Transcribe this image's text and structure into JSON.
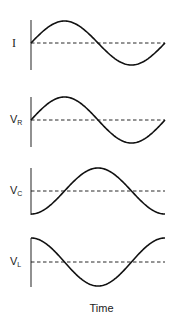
{
  "labels": {
    "current": "I",
    "vr_main": "V",
    "vr_sub": "R",
    "vc_main": "V",
    "vc_sub": "C",
    "vl_main": "V",
    "vl_sub": "L",
    "xaxis": "Time"
  },
  "chart_data": {
    "type": "line",
    "title": "",
    "xlabel": "Time",
    "ylabel": "",
    "grid": false,
    "panels": [
      {
        "name": "I",
        "function": "sin",
        "phase_deg": 0,
        "cycles": 1
      },
      {
        "name": "V_R",
        "function": "sin",
        "phase_deg": 0,
        "cycles": 1
      },
      {
        "name": "V_C",
        "function": "-cos",
        "phase_deg": -90,
        "cycles": 1
      },
      {
        "name": "V_L",
        "function": "cos",
        "phase_deg": 90,
        "cycles": 1
      }
    ]
  },
  "colors": {
    "stroke": "#111111",
    "axis": "#555555"
  }
}
